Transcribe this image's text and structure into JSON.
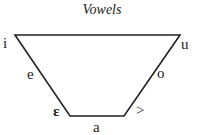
{
  "title": "Vowels",
  "vowels": {
    "top_left": "i",
    "top_right": "u",
    "left_mid": "e",
    "right_mid": "o",
    "bottom_left": "ɛ",
    "bottom_right": ">",
    "bottom_mid": "a"
  },
  "colors": {
    "line": "#222222"
  }
}
